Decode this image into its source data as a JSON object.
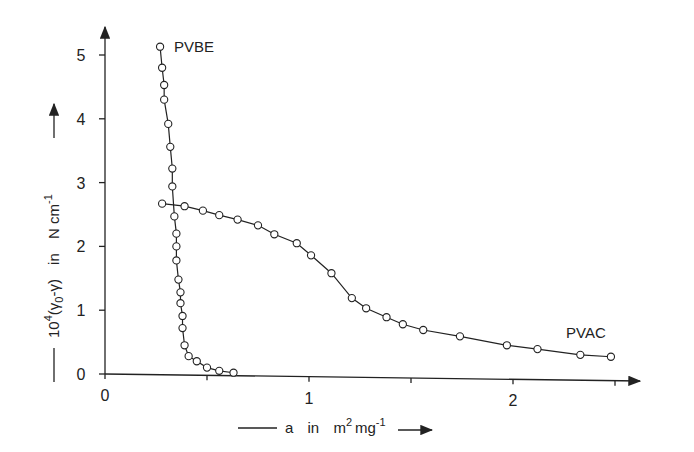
{
  "chart_data": {
    "type": "line",
    "title": "",
    "xlabel": "a in m² mg⁻¹",
    "ylabel": "10⁴(γ₀ − γ) in N cm⁻¹",
    "xlim": [
      0,
      2.7
    ],
    "ylim": [
      0,
      5.3
    ],
    "x_ticks": [
      0,
      0.5,
      1,
      1.5,
      2,
      2.5
    ],
    "x_tick_labels": [
      "0",
      "",
      "1",
      "",
      "2",
      ""
    ],
    "y_ticks": [
      0,
      1,
      2,
      3,
      4,
      5
    ],
    "y_tick_labels": [
      "0",
      "1",
      "2",
      "3",
      "4",
      "5"
    ],
    "grid": false,
    "legend": "inline labels next to curves",
    "markers": "open circles",
    "series": [
      {
        "name": "PVBE",
        "label_position": "top-right of first point",
        "x": [
          0.27,
          0.28,
          0.29,
          0.29,
          0.31,
          0.32,
          0.33,
          0.33,
          0.34,
          0.35,
          0.35,
          0.35,
          0.36,
          0.37,
          0.37,
          0.38,
          0.38,
          0.39,
          0.41,
          0.45,
          0.5,
          0.56,
          0.63
        ],
        "y": [
          5.13,
          4.8,
          4.53,
          4.3,
          3.92,
          3.56,
          3.22,
          2.94,
          2.47,
          2.2,
          2.0,
          1.78,
          1.48,
          1.28,
          1.11,
          0.91,
          0.72,
          0.45,
          0.28,
          0.2,
          0.1,
          0.05,
          0.02
        ]
      },
      {
        "name": "PVAC",
        "label_position": "above last points",
        "x": [
          0.28,
          0.39,
          0.48,
          0.56,
          0.65,
          0.75,
          0.83,
          0.94,
          1.01,
          1.11,
          1.21,
          1.28,
          1.38,
          1.46,
          1.56,
          1.74,
          1.97,
          2.12,
          2.33,
          2.48
        ],
        "y": [
          2.67,
          2.63,
          2.56,
          2.49,
          2.42,
          2.33,
          2.19,
          2.05,
          1.86,
          1.58,
          1.19,
          1.03,
          0.89,
          0.78,
          0.69,
          0.59,
          0.45,
          0.39,
          0.3,
          0.27
        ]
      }
    ]
  },
  "labels": {
    "x_axis_title_a": "a",
    "x_axis_title_in": "in",
    "x_axis_title_unit": "m",
    "x_axis_title_sup1": "2",
    "x_axis_title_unit2": "mg",
    "x_axis_title_sup2": "-1",
    "y_axis_title_prefix": "10",
    "y_axis_title_sup": "4",
    "y_axis_title_expr": "(γ",
    "y_axis_title_sub": "0",
    "y_axis_title_expr2": "-γ)",
    "y_axis_title_in": "in",
    "y_axis_title_unit": "N cm",
    "y_axis_title_unit_sup": "-1"
  },
  "layout": {
    "origin_px": [
      105,
      374
    ],
    "px_per_x": 204,
    "px_per_y": 63.8,
    "x_axis_end_px": 640,
    "y_axis_top_px": 27
  }
}
